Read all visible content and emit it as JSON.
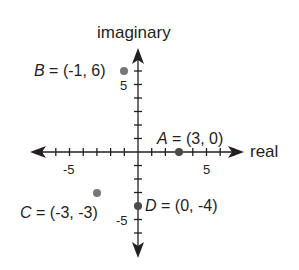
{
  "chart_data": {
    "type": "scatter",
    "title": "",
    "xlabel": "real",
    "ylabel": "imaginary",
    "xlim": [
      -7,
      7
    ],
    "ylim": [
      -7,
      7
    ],
    "grid": false,
    "x_tick_labels": [
      "-5",
      "5"
    ],
    "y_tick_labels": [
      "5",
      "-5"
    ],
    "points": [
      {
        "name": "A",
        "x": 3,
        "y": 0,
        "label": "A = (3, 0)"
      },
      {
        "name": "B",
        "x": -1,
        "y": 6,
        "label": "B = (-1, 6)"
      },
      {
        "name": "C",
        "x": -3,
        "y": -3,
        "label": "C = (-3, -3)"
      },
      {
        "name": "D",
        "x": 0,
        "y": -4,
        "label": "D = (0, -4)"
      }
    ]
  },
  "axes": {
    "x_label": "real",
    "y_label": "imaginary",
    "x_neg_tick": "-5",
    "x_pos_tick": "5",
    "y_pos_tick": "5",
    "y_neg_tick": "-5"
  },
  "points": {
    "A": {
      "name": "A",
      "rest": " = (3, 0)"
    },
    "B": {
      "name": "B",
      "rest": " = (-1, 6)"
    },
    "C": {
      "name": "C",
      "rest": " = (-3, -3)"
    },
    "D": {
      "name": "D",
      "rest": " = (0, -4)"
    }
  },
  "colors": {
    "axis": "#231f20",
    "point_dark": "#4a4a4a",
    "point_light": "#777777"
  }
}
